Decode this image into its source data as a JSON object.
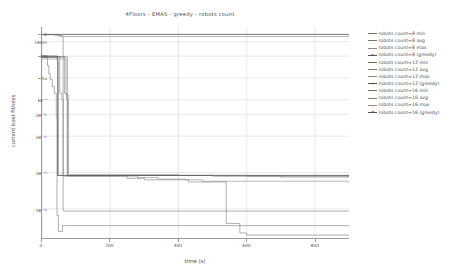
{
  "chart_data": {
    "type": "line",
    "title": "4Floors - EMAS - greedy - robots count",
    "xlabel": "time (s)",
    "ylabel": "current best fitness",
    "xlim": [
      0,
      900
    ],
    "ylim_log10": [
      -28,
      1
    ],
    "yscale": "log",
    "grid": true,
    "legend_position": "right",
    "xticks": [
      "0",
      "200",
      "400",
      "600",
      "800"
    ],
    "xtick_values": [
      0,
      200,
      400,
      600,
      800
    ],
    "yticks": [
      "1",
      "100m",
      "1m",
      "1u",
      "10⁻⁹",
      "10⁻¹¹",
      "10⁻¹⁴",
      "10⁻¹⁹",
      "10⁻²⁴"
    ],
    "ytick_log10": [
      0,
      -1,
      -3,
      -6,
      -9,
      -11,
      -14,
      -19,
      -24
    ],
    "series": [
      {
        "name": "robots count=8 min",
        "color": "#6d6d6d",
        "marker": "none",
        "points": [
          [
            0,
            -0.05
          ],
          [
            18,
            -0.05
          ],
          [
            40,
            -0.18
          ],
          [
            60,
            -0.3
          ],
          [
            62,
            -24.3
          ],
          [
            900,
            -24.3
          ]
        ]
      },
      {
        "name": "robots count=8 avg",
        "color": "#7a7a7a",
        "marker": "none",
        "points": [
          [
            0,
            -0.05
          ],
          [
            30,
            -0.05
          ],
          [
            52,
            -0.3
          ],
          [
            900,
            -0.3
          ]
        ]
      },
      {
        "name": "robots count=8 max",
        "color": "#888888",
        "marker": "none",
        "points": [
          [
            0,
            -0.02
          ],
          [
            55,
            -0.02
          ],
          [
            900,
            -0.02
          ]
        ]
      },
      {
        "name": "robots count=8 (greedy)",
        "color": "#555555",
        "marker": "plus",
        "points": [
          [
            0,
            -0.02
          ],
          [
            900,
            -0.02
          ]
        ]
      },
      {
        "name": "robots count=12 min",
        "color": "#6a6a6a",
        "marker": "none",
        "points": [
          [
            0,
            -3.0
          ],
          [
            12,
            -3.0
          ],
          [
            16,
            -4.3
          ],
          [
            20,
            -5.4
          ],
          [
            24,
            -6.2
          ],
          [
            30,
            -7.2
          ],
          [
            36,
            -8.1
          ],
          [
            42,
            -11.4
          ],
          [
            44,
            -24.9
          ],
          [
            48,
            -27.1
          ],
          [
            56,
            -27.1
          ],
          [
            60,
            -26.3
          ],
          [
            70,
            -26.3
          ],
          [
            900,
            -26.3
          ]
        ]
      },
      {
        "name": "robots count=12 avg",
        "color": "#777777",
        "marker": "none",
        "points": [
          [
            0,
            -3.0
          ],
          [
            30,
            -3.0
          ],
          [
            44,
            -3.6
          ],
          [
            46,
            -19.4
          ],
          [
            900,
            -19.4
          ]
        ]
      },
      {
        "name": "robots count=12 max",
        "color": "#858585",
        "marker": "none",
        "points": [
          [
            0,
            -3.2
          ],
          [
            34,
            -3.2
          ],
          [
            46,
            -3.9
          ],
          [
            48,
            -19.4
          ],
          [
            900,
            -19.4
          ]
        ]
      },
      {
        "name": "robots count=12 (greedy)",
        "color": "#4f4f4f",
        "marker": "plus",
        "points": [
          [
            0,
            -3.0
          ],
          [
            44,
            -3.0
          ],
          [
            46,
            -19.4
          ],
          [
            900,
            -19.4
          ]
        ]
      },
      {
        "name": "robots count=16 min",
        "color": "#6f6f6f",
        "marker": "none",
        "points": [
          [
            0,
            -3.1
          ],
          [
            40,
            -3.1
          ],
          [
            52,
            -8.1
          ],
          [
            58,
            -9.0
          ],
          [
            62,
            -19.5
          ],
          [
            180,
            -19.5
          ],
          [
            250,
            -19.8
          ],
          [
            300,
            -20.0
          ],
          [
            430,
            -20.3
          ],
          [
            520,
            -20.3
          ],
          [
            540,
            -26.0
          ],
          [
            560,
            -26.0
          ],
          [
            580,
            -27.3
          ],
          [
            600,
            -27.6
          ],
          [
            900,
            -27.6
          ]
        ]
      },
      {
        "name": "robots count=16 avg",
        "color": "#7d7d7d",
        "marker": "none",
        "points": [
          [
            0,
            -3.1
          ],
          [
            60,
            -3.1
          ],
          [
            66,
            -8.1
          ],
          [
            72,
            -8.9
          ],
          [
            76,
            -19.5
          ],
          [
            210,
            -19.5
          ],
          [
            280,
            -19.7
          ],
          [
            340,
            -19.9
          ],
          [
            420,
            -20.0
          ],
          [
            470,
            -20.2
          ],
          [
            900,
            -20.4
          ]
        ]
      },
      {
        "name": "robots count=16 max",
        "color": "#8c8c8c",
        "marker": "none",
        "points": [
          [
            0,
            -3.4
          ],
          [
            62,
            -3.4
          ],
          [
            70,
            -8.3
          ],
          [
            78,
            -19.3
          ],
          [
            250,
            -19.3
          ],
          [
            400,
            -19.4
          ],
          [
            600,
            -19.5
          ],
          [
            900,
            -19.6
          ]
        ]
      },
      {
        "name": "robots count=16 (greedy)",
        "color": "#525252",
        "marker": "plus",
        "points": [
          [
            0,
            -3.1
          ],
          [
            64,
            -3.1
          ],
          [
            74,
            -19.4
          ],
          [
            300,
            -19.4
          ],
          [
            500,
            -19.5
          ],
          [
            700,
            -19.6
          ],
          [
            900,
            -19.7
          ]
        ]
      }
    ]
  },
  "legend": {
    "items": [
      {
        "label": "robots count=8 min",
        "color": "#6d6d6d",
        "marker": "none"
      },
      {
        "label": "robots count=8 avg",
        "color": "#7a7a7a",
        "marker": "none"
      },
      {
        "label": "robots count=8 max",
        "color": "#888888",
        "marker": "none"
      },
      {
        "label": "robots count=8 (greedy)",
        "color": "#555555",
        "marker": "plus"
      },
      {
        "label": "robots count=12 min",
        "color": "#6a6a6a",
        "marker": "none"
      },
      {
        "label": "robots count=12 avg",
        "color": "#777777",
        "marker": "none"
      },
      {
        "label": "robots count=12 max",
        "color": "#858585",
        "marker": "none"
      },
      {
        "label": "robots count=12 (greedy)",
        "color": "#4f4f4f",
        "marker": "plus"
      },
      {
        "label": "robots count=16 min",
        "color": "#6f6f6f",
        "marker": "none"
      },
      {
        "label": "robots count=16 avg",
        "color": "#7d7d7d",
        "marker": "none"
      },
      {
        "label": "robots count=16 max",
        "color": "#8c8c8c",
        "marker": "none"
      },
      {
        "label": "robots count=16 (greedy)",
        "color": "#525252",
        "marker": "plus"
      }
    ]
  },
  "style": {
    "grid_color": "#cfcfcf",
    "axis_color": "#9a9a9a",
    "text_color": "#4c4c4c",
    "background": "#ffffff"
  }
}
